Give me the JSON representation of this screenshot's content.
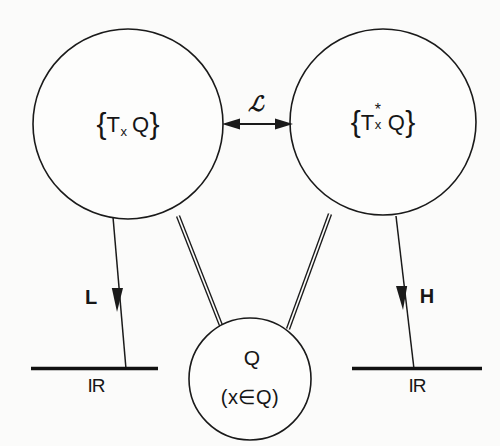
{
  "diagram": {
    "background_color": "#fbfbfa",
    "ink_color": "#1a1a1a",
    "nodes": {
      "tangent_space": {
        "label_plain": "{T_x Q}",
        "open_brace": "{",
        "base": "T",
        "sub": "x",
        "sup": "",
        "manifold": "Q",
        "close_brace": "}"
      },
      "cotangent_space": {
        "label_plain": "{T*_x Q}",
        "open_brace": "{",
        "base": "T",
        "sub": "x",
        "sup": "*",
        "manifold": "Q",
        "close_brace": "}"
      },
      "configuration_space": {
        "label_plain": "Q",
        "membership": "(x∈Q)"
      }
    },
    "edges": {
      "legendre": {
        "label": "ℒ",
        "label_plain": "L (script)",
        "arrow_style": "double-headed"
      },
      "lagrangian": {
        "label": "L",
        "arrow_style": "single-headed-down"
      },
      "hamiltonian": {
        "label": "H",
        "arrow_style": "single-headed-down"
      },
      "tangent_to_base": {
        "label": "",
        "arrow_style": "double-line"
      },
      "cotangent_to_base": {
        "label": "",
        "arrow_style": "double-line"
      }
    },
    "axes": {
      "left_target": "IR",
      "right_target": "IR"
    }
  }
}
